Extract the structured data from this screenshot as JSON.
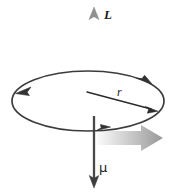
{
  "figure": {
    "background_color": "#ffffff",
    "width": 176,
    "height": 194,
    "labels": {
      "angular_momentum": "L",
      "radius": "r",
      "magnetic_moment": "μ"
    },
    "elements": {
      "loop": {
        "name": "current-loop-ellipse",
        "center_x": 88,
        "center_y": 101,
        "radius_x": 76,
        "radius_y": 30,
        "stroke_color": "#3a3a3a",
        "stroke_width": 1.6,
        "direction_arrow_count": 3,
        "direction": "counterclockwise-viewed-from-below"
      },
      "angular_momentum_vector": {
        "name": "angular-momentum-arrow",
        "x": 94,
        "y_start": 101,
        "y_end": 9,
        "direction": "up",
        "stroke_color": "#8c8c8c",
        "stroke_width": 3.4
      },
      "magnetic_moment_vector": {
        "name": "magnetic-moment-arrow",
        "x": 94,
        "y_start": 118,
        "y_end": 186,
        "direction": "down",
        "stroke_color": "#3a3a3a",
        "stroke_width": 2.2
      },
      "radius_vector": {
        "name": "radius-arrow",
        "x_start": 88,
        "y_start": 92,
        "x_end": 156,
        "y_end": 110,
        "stroke_color": "#2b2b2b",
        "stroke_width": 1.3
      },
      "rotation_block_arrow": {
        "name": "rotation-direction-block-arrow",
        "x": 96,
        "y": 127,
        "width": 66,
        "height": 24,
        "direction": "right",
        "fill_gradient_start": "#f2f2f2",
        "fill_gradient_end": "#9a9a9a"
      }
    },
    "colors": {
      "loop_stroke": "#3a3a3a",
      "L_arrow": "#8c8c8c",
      "mu_arrow": "#3a3a3a",
      "radius_arrow": "#2b2b2b",
      "block_arrow": "#b0b0b0",
      "text": "#1a1a1a"
    }
  }
}
